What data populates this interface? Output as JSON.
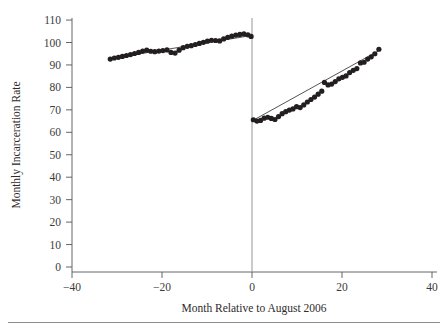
{
  "figure": {
    "background": "#ffffff",
    "ink_color": "#231f20",
    "axis_color": "#555555",
    "cutoff_color": "#8a8a8a"
  },
  "chart_data": {
    "type": "scatter",
    "title": "",
    "subtitle": "",
    "xlabel": "Month Relative to August 2006",
    "ylabel": "Monthly Incarceration Rate",
    "xlim": [
      -45,
      45
    ],
    "ylim": [
      0,
      113
    ],
    "xticks": [
      -40,
      -20,
      0,
      20,
      40
    ],
    "xtick_labels": [
      "−40",
      "−20",
      "0",
      "20",
      "40"
    ],
    "yticks": [
      0,
      10,
      20,
      30,
      40,
      50,
      60,
      70,
      80,
      90,
      100,
      110
    ],
    "ytick_labels": [
      "0",
      "10",
      "20",
      "30",
      "40",
      "50",
      "60",
      "70",
      "80",
      "90",
      "100",
      "110"
    ],
    "grid": false,
    "legend": "none",
    "annotations": [
      {
        "name": "cutoff-line",
        "type": "vline",
        "x": 0,
        "label": ""
      }
    ],
    "series": [
      {
        "name": "Pre-period monthly incarceration rate",
        "marker": "filled-circle",
        "x": [
          -31.5,
          -30.6,
          -29.7,
          -28.8,
          -27.9,
          -27.0,
          -26.1,
          -25.2,
          -24.3,
          -23.4,
          -22.5,
          -21.6,
          -20.7,
          -19.8,
          -18.9,
          -18.0,
          -17.1,
          -16.2,
          -15.3,
          -14.4,
          -13.5,
          -12.6,
          -11.7,
          -10.8,
          -9.9,
          -9.0,
          -8.1,
          -7.2,
          -6.3,
          -5.4,
          -4.5,
          -3.6,
          -2.7,
          -1.8,
          -0.9,
          -0.2
        ],
        "y": [
          92.6,
          93.1,
          93.4,
          93.8,
          94.2,
          94.6,
          95.1,
          95.6,
          96.2,
          96.6,
          96.1,
          95.9,
          96.2,
          96.4,
          96.7,
          95.6,
          95.3,
          96.6,
          97.7,
          98.3,
          98.6,
          99.1,
          99.6,
          100.1,
          100.6,
          101.0,
          100.9,
          100.7,
          101.6,
          102.3,
          102.8,
          103.3,
          103.6,
          103.8,
          103.4,
          102.7
        ]
      },
      {
        "name": "Post-period monthly incarceration rate",
        "marker": "filled-circle",
        "x": [
          0.3,
          1.1,
          1.9,
          2.7,
          3.5,
          4.3,
          5.1,
          5.9,
          6.7,
          7.5,
          8.3,
          9.1,
          9.9,
          10.7,
          11.5,
          12.3,
          13.1,
          13.9,
          14.7,
          15.5,
          16.1,
          16.9,
          17.7,
          18.5,
          19.3,
          20.1,
          20.9,
          21.7,
          22.5,
          23.3,
          24.1,
          24.9,
          25.7,
          26.5,
          27.3,
          28.2
        ],
        "y": [
          65.6,
          65.0,
          65.3,
          66.3,
          66.7,
          66.2,
          65.7,
          67.0,
          68.3,
          69.2,
          69.9,
          70.4,
          71.4,
          71.0,
          72.2,
          73.5,
          74.6,
          75.7,
          77.0,
          78.3,
          82.2,
          81.1,
          81.5,
          82.6,
          83.8,
          84.5,
          85.1,
          86.6,
          87.6,
          88.4,
          90.9,
          91.2,
          92.6,
          93.6,
          95.0,
          97.0
        ]
      }
    ],
    "fit_lines": [
      {
        "name": "pre-trend-fit",
        "x": [
          -31.5,
          -0.2
        ],
        "y": [
          92.8,
          103.1
        ]
      },
      {
        "name": "post-trend-fit",
        "x": [
          0.3,
          28.2
        ],
        "y": [
          65.4,
          96.4
        ]
      }
    ],
    "discontinuity": {
      "x": 0,
      "pre_value": 102.7,
      "post_value": 65.6,
      "jump": -37.1
    }
  }
}
